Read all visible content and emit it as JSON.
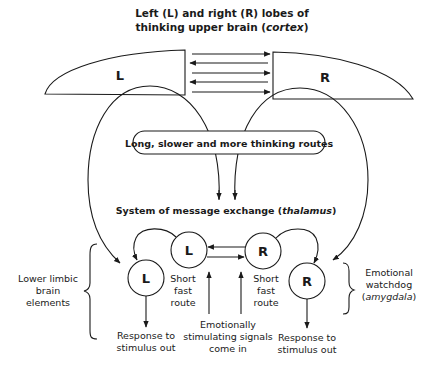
{
  "title": {
    "line1": "Left (L) and right (R) lobes of",
    "line2_prefix": "thinking upper brain (",
    "line2_italic": "cortex",
    "line2_suffix": ")"
  },
  "cortex": {
    "left_label": "L",
    "right_label": "R"
  },
  "pill": {
    "label": "Long, slower and more thinking routes"
  },
  "thalamus": {
    "prefix": "System of message exchange (",
    "italic": "thalamus",
    "suffix": ")"
  },
  "limbic": {
    "upper_left_label": "L",
    "upper_right_label": "R",
    "lower_left_label": "L",
    "lower_right_label": "R"
  },
  "labels": {
    "lower_limbic": [
      "Lower limbic",
      "brain",
      "elements"
    ],
    "short_route_left": [
      "Short",
      "fast",
      "route"
    ],
    "short_route_right": [
      "Short",
      "fast",
      "route"
    ],
    "emotional_signals": [
      "Emotionally",
      "stimulating signals",
      "come in"
    ],
    "response_left": [
      "Response to",
      "stimulus out"
    ],
    "response_right": [
      "Response to",
      "stimulus out"
    ],
    "watchdog_line1": "Emotional",
    "watchdog_line2": "watchdog",
    "watchdog_italic_prefix": "(",
    "watchdog_italic": "amygdala",
    "watchdog_italic_suffix": ")"
  },
  "colors": {
    "ink": "#1a1a1a",
    "background": "#ffffff"
  }
}
